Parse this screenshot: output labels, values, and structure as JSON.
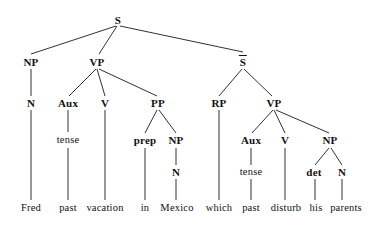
{
  "figure": {
    "type": "syntax-tree",
    "sentence": "Fred past vacation in Mexico which past disturb his parents",
    "line_color": "#1a1a1a",
    "text_color": "#111111",
    "background": "#ffffff"
  },
  "nodes": [
    {
      "id": "S",
      "label": "S",
      "kind": "category",
      "overbar": false,
      "x": 118,
      "y": 20
    },
    {
      "id": "NP1",
      "label": "NP",
      "kind": "category",
      "overbar": false,
      "x": 31,
      "y": 62
    },
    {
      "id": "VP1",
      "label": "VP",
      "kind": "category",
      "overbar": false,
      "x": 97,
      "y": 62
    },
    {
      "id": "SBAR",
      "label": "S",
      "kind": "category",
      "overbar": true,
      "x": 243,
      "y": 62
    },
    {
      "id": "N1",
      "label": "N",
      "kind": "category",
      "overbar": false,
      "x": 31,
      "y": 103
    },
    {
      "id": "AUX1",
      "label": "Aux",
      "kind": "category",
      "overbar": false,
      "x": 68,
      "y": 103
    },
    {
      "id": "V1",
      "label": "V",
      "kind": "category",
      "overbar": false,
      "x": 105,
      "y": 103
    },
    {
      "id": "PP",
      "label": "PP",
      "kind": "category",
      "overbar": false,
      "x": 158,
      "y": 103
    },
    {
      "id": "RP",
      "label": "RP",
      "kind": "category",
      "overbar": false,
      "x": 219,
      "y": 103
    },
    {
      "id": "VP2",
      "label": "VP",
      "kind": "category",
      "overbar": false,
      "x": 274,
      "y": 103
    },
    {
      "id": "TENSE1",
      "label": "tense",
      "kind": "terminal",
      "overbar": false,
      "x": 68,
      "y": 140
    },
    {
      "id": "PREP",
      "label": "prep",
      "kind": "category",
      "overbar": false,
      "x": 145,
      "y": 140
    },
    {
      "id": "NP2",
      "label": "NP",
      "kind": "category",
      "overbar": false,
      "x": 176,
      "y": 140
    },
    {
      "id": "AUX2",
      "label": "Aux",
      "kind": "category",
      "overbar": false,
      "x": 251,
      "y": 140
    },
    {
      "id": "V2",
      "label": "V",
      "kind": "category",
      "overbar": false,
      "x": 285,
      "y": 140
    },
    {
      "id": "NP3",
      "label": "NP",
      "kind": "category",
      "overbar": false,
      "x": 330,
      "y": 140
    },
    {
      "id": "N2",
      "label": "N",
      "kind": "category",
      "overbar": false,
      "x": 176,
      "y": 172
    },
    {
      "id": "TENSE2",
      "label": "tense",
      "kind": "terminal",
      "overbar": false,
      "x": 251,
      "y": 172
    },
    {
      "id": "DET",
      "label": "det",
      "kind": "category",
      "overbar": false,
      "x": 314,
      "y": 172
    },
    {
      "id": "N3",
      "label": "N",
      "kind": "category",
      "overbar": false,
      "x": 342,
      "y": 172
    }
  ],
  "leaves": [
    {
      "id": "L1",
      "label": "Fred",
      "x": 31,
      "y": 208
    },
    {
      "id": "L2",
      "label": "past",
      "x": 68,
      "y": 208
    },
    {
      "id": "L3",
      "label": "vacation",
      "x": 105,
      "y": 208
    },
    {
      "id": "L4",
      "label": "in",
      "x": 145,
      "y": 208
    },
    {
      "id": "L5",
      "label": "Mexico",
      "x": 177,
      "y": 208
    },
    {
      "id": "L6",
      "label": "which",
      "x": 219,
      "y": 208
    },
    {
      "id": "L7",
      "label": "past",
      "x": 251,
      "y": 208
    },
    {
      "id": "L8",
      "label": "disturb",
      "x": 286,
      "y": 208
    },
    {
      "id": "L9",
      "label": "his",
      "x": 316,
      "y": 208
    },
    {
      "id": "L10",
      "label": "parents",
      "x": 346,
      "y": 208
    }
  ],
  "edges": [
    {
      "from": "S",
      "to": "NP1",
      "x1": 116,
      "y1": 26,
      "x2": 31,
      "y2": 54
    },
    {
      "from": "S",
      "to": "VP1",
      "x1": 117,
      "y1": 26,
      "x2": 99,
      "y2": 54
    },
    {
      "from": "S",
      "to": "SBAR",
      "x1": 120,
      "y1": 26,
      "x2": 243,
      "y2": 52
    },
    {
      "from": "NP1",
      "to": "N1",
      "x1": 31,
      "y1": 69,
      "x2": 31,
      "y2": 96
    },
    {
      "from": "VP1",
      "to": "AUX1",
      "x1": 96,
      "y1": 69,
      "x2": 69,
      "y2": 96
    },
    {
      "from": "VP1",
      "to": "V1",
      "x1": 97,
      "y1": 69,
      "x2": 105,
      "y2": 96
    },
    {
      "from": "VP1",
      "to": "PP",
      "x1": 99,
      "y1": 69,
      "x2": 157,
      "y2": 96
    },
    {
      "from": "SBAR",
      "to": "RP",
      "x1": 242,
      "y1": 69,
      "x2": 219,
      "y2": 96
    },
    {
      "from": "SBAR",
      "to": "VP2",
      "x1": 244,
      "y1": 69,
      "x2": 272,
      "y2": 96
    },
    {
      "from": "N1",
      "to": "L1",
      "x1": 31,
      "y1": 110,
      "x2": 31,
      "y2": 200
    },
    {
      "from": "AUX1",
      "to": "TENSE1",
      "x1": 68,
      "y1": 110,
      "x2": 68,
      "y2": 132
    },
    {
      "from": "TENSE1",
      "to": "L2",
      "x1": 68,
      "y1": 148,
      "x2": 68,
      "y2": 200
    },
    {
      "from": "V1",
      "to": "L3",
      "x1": 105,
      "y1": 110,
      "x2": 105,
      "y2": 200
    },
    {
      "from": "PP",
      "to": "PREP",
      "x1": 157,
      "y1": 110,
      "x2": 145,
      "y2": 133
    },
    {
      "from": "PP",
      "to": "NP2",
      "x1": 159,
      "y1": 110,
      "x2": 176,
      "y2": 133
    },
    {
      "from": "PREP",
      "to": "L4",
      "x1": 145,
      "y1": 148,
      "x2": 145,
      "y2": 200
    },
    {
      "from": "NP2",
      "to": "N2",
      "x1": 176,
      "y1": 148,
      "x2": 176,
      "y2": 165
    },
    {
      "from": "N2",
      "to": "L5",
      "x1": 176,
      "y1": 179,
      "x2": 176,
      "y2": 200
    },
    {
      "from": "RP",
      "to": "L6",
      "x1": 219,
      "y1": 110,
      "x2": 219,
      "y2": 200
    },
    {
      "from": "VP2",
      "to": "AUX2",
      "x1": 273,
      "y1": 110,
      "x2": 252,
      "y2": 133
    },
    {
      "from": "VP2",
      "to": "V2",
      "x1": 274,
      "y1": 110,
      "x2": 285,
      "y2": 133
    },
    {
      "from": "VP2",
      "to": "NP3",
      "x1": 276,
      "y1": 110,
      "x2": 329,
      "y2": 133
    },
    {
      "from": "AUX2",
      "to": "TENSE2",
      "x1": 251,
      "y1": 148,
      "x2": 251,
      "y2": 165
    },
    {
      "from": "TENSE2",
      "to": "L7",
      "x1": 251,
      "y1": 179,
      "x2": 251,
      "y2": 200
    },
    {
      "from": "V2",
      "to": "L8",
      "x1": 285,
      "y1": 148,
      "x2": 285,
      "y2": 200
    },
    {
      "from": "NP3",
      "to": "DET",
      "x1": 329,
      "y1": 148,
      "x2": 315,
      "y2": 165
    },
    {
      "from": "NP3",
      "to": "N3",
      "x1": 331,
      "y1": 148,
      "x2": 342,
      "y2": 165
    },
    {
      "from": "DET",
      "to": "L9",
      "x1": 315,
      "y1": 179,
      "x2": 315,
      "y2": 200
    },
    {
      "from": "N3",
      "to": "L10",
      "x1": 342,
      "y1": 179,
      "x2": 342,
      "y2": 200
    }
  ]
}
